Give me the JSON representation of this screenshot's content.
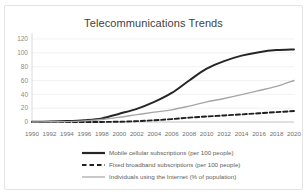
{
  "chart_data": {
    "type": "line",
    "title": "Telecommunications Trends",
    "xlabel": "",
    "ylabel": "",
    "ylim": [
      0,
      120
    ],
    "xlim": [
      1990,
      2020
    ],
    "grid": true,
    "legend_position": "bottom",
    "yticks": [
      "0",
      "20",
      "40",
      "60",
      "80",
      "100",
      "120"
    ],
    "ytick_values": [
      0,
      20,
      40,
      60,
      80,
      100,
      120
    ],
    "categories": [
      1990,
      1992,
      1994,
      1996,
      1998,
      2000,
      2002,
      2004,
      2006,
      2008,
      2010,
      2012,
      2014,
      2016,
      2018,
      2020
    ],
    "xticks": [
      "1990",
      "1992",
      "1994",
      "1996",
      "1998",
      "2000",
      "2002",
      "2004",
      "2006",
      "2008",
      "2010",
      "2012",
      "2014",
      "2016",
      "2018",
      "2020"
    ],
    "series": [
      {
        "name": "Mobile cellular subscriptions (per 100 people)",
        "style": "solid",
        "color": "#262626",
        "width": 2.0,
        "values": [
          0.2,
          0.6,
          1.3,
          2.6,
          5.2,
          12.0,
          19.0,
          29.0,
          42.0,
          60.0,
          77.0,
          88.0,
          96.0,
          101.0,
          104.0,
          105.0
        ]
      },
      {
        "name": "Fixed broadband subscriptions (per 100 people)",
        "style": "dashed",
        "color": "#1f1f1f",
        "width": 1.9,
        "values": [
          0.0,
          0.0,
          0.0,
          0.0,
          0.1,
          0.4,
          1.2,
          2.5,
          4.2,
          6.3,
          8.0,
          9.5,
          11.0,
          12.6,
          14.3,
          15.8
        ]
      },
      {
        "name": "Individuals using the Internet (% of population)",
        "style": "solid",
        "color": "#a6a6a6",
        "width": 1.4,
        "values": [
          0.1,
          0.3,
          0.6,
          1.6,
          3.6,
          6.8,
          10.6,
          14.2,
          17.6,
          23.0,
          29.0,
          34.0,
          39.5,
          45.5,
          51.5,
          60.0
        ]
      }
    ]
  },
  "legend": {
    "items": [
      {
        "label": "Mobile cellular subscriptions (per 100 people)",
        "style": "solid",
        "color": "#262626",
        "width": 2.2
      },
      {
        "label": "Fixed broadband subscriptions (per 100 people)",
        "style": "dashed",
        "color": "#1f1f1f",
        "width": 2.2
      },
      {
        "label": "Individuals using the Internet (% of population)",
        "style": "solid",
        "color": "#a6a6a6",
        "width": 1.2
      }
    ]
  },
  "colors": {
    "mobile": "#262626",
    "broadband": "#1f1f1f",
    "internet": "#a6a6a6",
    "grid": "#ededed",
    "border": "#e3e3e3",
    "title_text": "#3f3f3f",
    "tick_text": "#8a8a8a"
  }
}
